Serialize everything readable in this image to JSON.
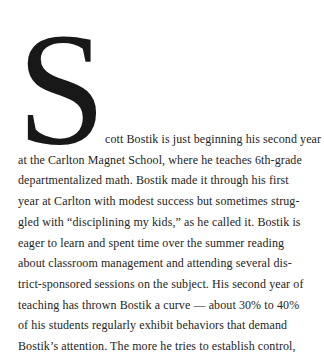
{
  "page": {
    "background": "#ffffff",
    "text_color": "#242424",
    "dropcap_color": "#181818"
  },
  "article": {
    "dropcap": "S",
    "body_text": "cott Bostik is just beginning his second year\nat the Carlton Magnet School, where he teaches 6th-grade\ndepartmentalized math. Bostik made it through his first\nyear at Carlton with modest success but sometimes strug-\ngled with “disciplining my kids,” as he called it. Bostik is\neager to learn and spent time over the summer reading\nabout classroom management and attending several dis-\ntrict-sponsored sessions on the subject. His second year of\nteaching has thrown Bostik a curve — about 30% to 40%\nof his students regularly exhibit behaviors that demand\nBostik’s attention. The more he tries to establish control,"
  }
}
